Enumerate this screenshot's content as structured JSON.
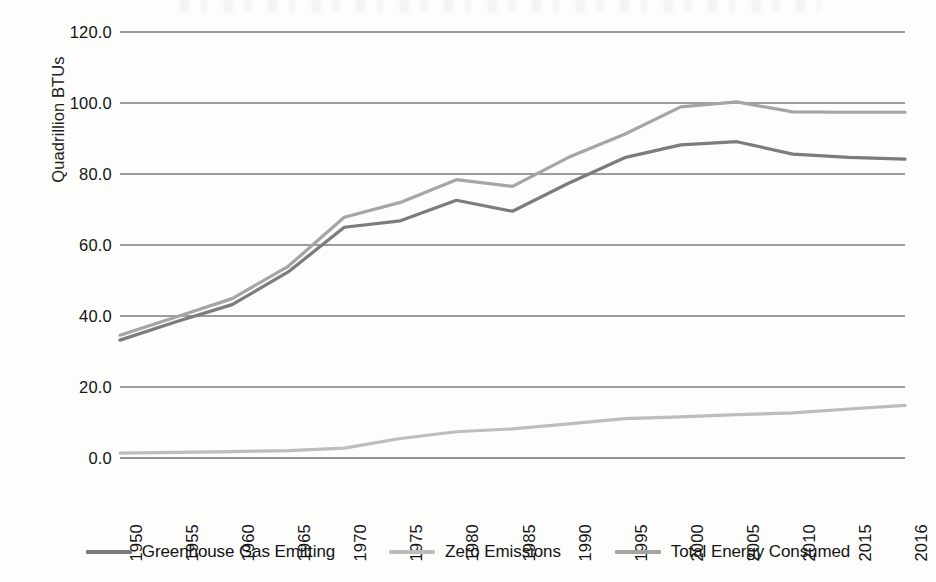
{
  "chart_data": {
    "type": "line",
    "title": "",
    "xlabel": "",
    "ylabel": "Quadrillion BTUs",
    "x": [
      1950,
      1955,
      1960,
      1965,
      1970,
      1975,
      1980,
      1985,
      1990,
      1995,
      2000,
      2005,
      2010,
      2015,
      2016
    ],
    "categories": [
      "1950",
      "1955",
      "1960",
      "1965",
      "1970",
      "1975",
      "1980",
      "1985",
      "1990",
      "1995",
      "2000",
      "2005",
      "2010",
      "2015",
      "2016"
    ],
    "ylim": [
      0,
      120
    ],
    "yticks": [
      0,
      20,
      40,
      60,
      80,
      100,
      120
    ],
    "ytick_labels": [
      "0.0",
      "20.0",
      "40.0",
      "60.0",
      "80.0",
      "100.0",
      "120.0"
    ],
    "grid": true,
    "legend_position": "bottom",
    "series": [
      {
        "name": "Greenhouse Gas Emitting",
        "color": "#7c7c7c",
        "values": [
          33.2,
          38.4,
          43.2,
          52.4,
          65.0,
          66.8,
          72.6,
          69.5,
          77.4,
          84.6,
          88.2,
          89.1,
          85.6,
          84.7,
          84.2
        ]
      },
      {
        "name": "Zero Emissions",
        "color": "#bdbdbd",
        "values": [
          1.4,
          1.6,
          1.8,
          2.1,
          2.8,
          5.5,
          7.4,
          8.2,
          9.6,
          11.1,
          11.6,
          12.2,
          12.7,
          13.8,
          14.8
        ]
      },
      {
        "name": "Total Energy Consumed",
        "color": "#a5a5a5",
        "values": [
          34.6,
          39.7,
          44.9,
          54.0,
          67.8,
          72.0,
          78.4,
          76.5,
          84.7,
          91.2,
          98.9,
          100.3,
          97.5,
          97.4,
          97.4
        ]
      }
    ]
  },
  "legend": {
    "items": [
      {
        "label": "Greenhouse Gas Emitting",
        "color": "#7c7c7c"
      },
      {
        "label": "Zero Emissions",
        "color": "#bdbdbd"
      },
      {
        "label": "Total Energy Consumed",
        "color": "#a5a5a5"
      }
    ]
  }
}
